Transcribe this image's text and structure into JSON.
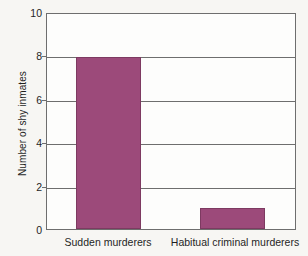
{
  "chart_data": {
    "type": "bar",
    "title": "",
    "subtitle": "",
    "xlabel": "",
    "ylabel": "Number of shy inmates",
    "categories": [
      "Sudden murderers",
      "Habitual criminal murderers"
    ],
    "values": [
      8,
      1
    ],
    "ylim": [
      0,
      10
    ],
    "yticks": [
      0,
      2,
      4,
      6,
      8,
      10
    ],
    "ytick_labels": [
      "0",
      "2",
      "4",
      "6",
      "8",
      "10"
    ],
    "grid": "horizontal",
    "legend": "none",
    "bar_color": "#9c4a7a",
    "bar_edge_color": "#7d3a61",
    "frame_color": "#6e6e6e",
    "background_color": "#f7f6f3",
    "plot_background_color": "#fdfdfc"
  },
  "axis": {
    "y_title": "Number of shy inmates"
  }
}
